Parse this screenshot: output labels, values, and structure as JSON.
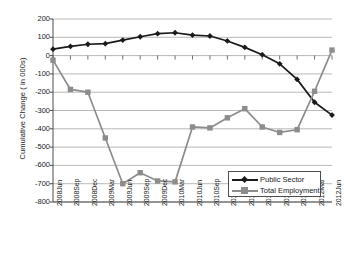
{
  "chart_data": {
    "type": "line",
    "title": "",
    "xlabel": "",
    "ylabel": "Cumulative  Change  ( in 000s)",
    "ylim": [
      -800,
      200
    ],
    "ytick_step": 100,
    "yticks": [
      200,
      100,
      0,
      -100,
      -200,
      -300,
      -400,
      -500,
      -600,
      -700,
      -800
    ],
    "ytick_labels": [
      "200",
      "100",
      "0",
      "-100",
      "-200",
      "-300",
      "-400",
      "-500",
      "-600",
      "-700",
      "-800"
    ],
    "grid": true,
    "legend_position": "lower-right-inside",
    "categories": [
      "2008Jun",
      "2008Sep",
      "2008Dec",
      "2009Mar",
      "2009Jun",
      "2009Sep",
      "2009Dec",
      "2010Mar",
      "2010Jun",
      "2010Sep",
      "2010Dec",
      "2011Mar",
      "2011Jun",
      "2011Sep",
      "2011Dec",
      "2012Mar",
      "2012Jun"
    ],
    "series": [
      {
        "name": "Public Sector",
        "color": "#1a1a1a",
        "marker": "diamond",
        "values": [
          35,
          50,
          62,
          65,
          85,
          103,
          120,
          125,
          112,
          107,
          80,
          45,
          5,
          -45,
          -130,
          -255,
          -325
        ]
      },
      {
        "name": "Total Employment",
        "color": "#8c8c8c",
        "marker": "square",
        "values": [
          -25,
          -185,
          -200,
          -450,
          -700,
          -640,
          -685,
          -690,
          -390,
          -395,
          -340,
          -290,
          -390,
          -420,
          -405,
          -195,
          30
        ]
      }
    ]
  },
  "legend": {
    "items": [
      {
        "label": "Public Sector"
      },
      {
        "label": "Total Employment"
      }
    ]
  },
  "colors": {
    "public_sector": "#1a1a1a",
    "total_employment": "#8c8c8c",
    "grid": "#a6a6a6",
    "axis": "#4d4d4d",
    "background": "#ffffff"
  }
}
